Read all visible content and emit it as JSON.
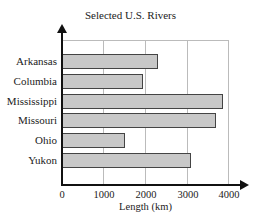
{
  "chart_data": {
    "type": "bar",
    "orientation": "horizontal",
    "title": "Selected U.S. Rivers",
    "categories": [
      "Arkansas",
      "Columbia",
      "Mississippi",
      "Missouri",
      "Ohio",
      "Yukon"
    ],
    "values": [
      2300,
      1950,
      3850,
      3700,
      1500,
      3100
    ],
    "xlabel": "Length (km)",
    "ylabel": "",
    "xlim": [
      0,
      4000
    ],
    "xticks": [
      "0",
      "1000",
      "2000",
      "3000",
      "4000"
    ],
    "grid": true,
    "bar_color": "#c8c8c8",
    "legend": null
  }
}
